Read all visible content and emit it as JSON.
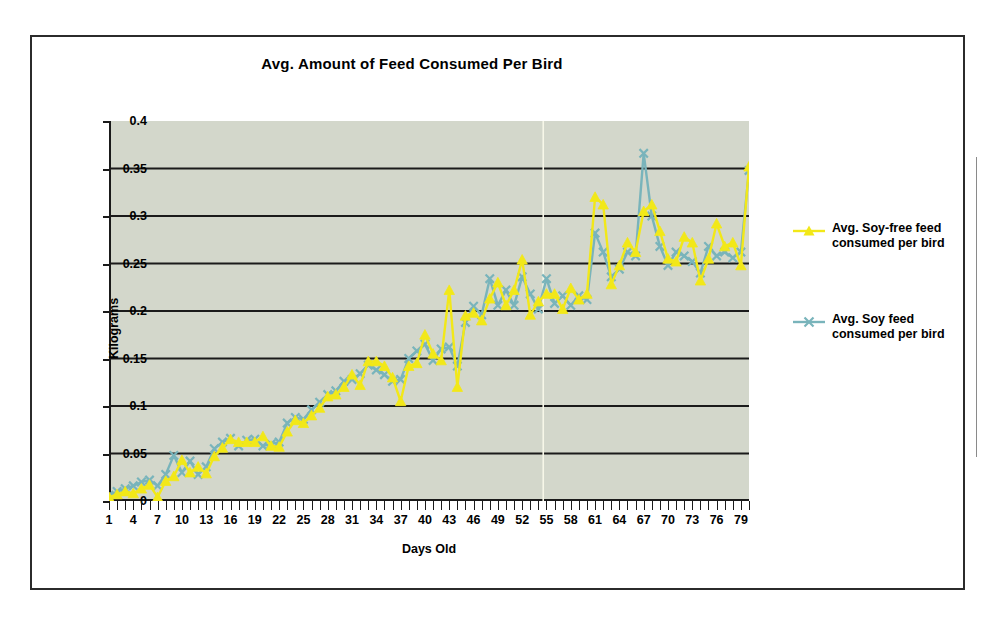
{
  "chart_data": {
    "type": "line",
    "title": "Avg. Amount of Feed Consumed Per Bird",
    "xlabel": "Days Old",
    "ylabel": "Kilograms",
    "grid": true,
    "grid_axis": "y",
    "legend_position": "right",
    "xlim": [
      1,
      80
    ],
    "ylim": [
      0,
      0.4
    ],
    "yticks": [
      0,
      0.05,
      0.1,
      0.15,
      0.2,
      0.25,
      0.3,
      0.35,
      0.4
    ],
    "ytick_labels": [
      "0",
      "0.05",
      "0.1",
      "0.15",
      "0.2",
      "0.25",
      "0.3",
      "0.35",
      "0.4"
    ],
    "xticks": [
      1,
      4,
      7,
      10,
      13,
      16,
      19,
      22,
      25,
      28,
      31,
      34,
      37,
      40,
      43,
      46,
      49,
      52,
      55,
      58,
      61,
      64,
      67,
      70,
      73,
      76,
      79
    ],
    "xtick_labels": [
      "1",
      "4",
      "7",
      "10",
      "13",
      "16",
      "19",
      "22",
      "25",
      "28",
      "31",
      "34",
      "37",
      "40",
      "43",
      "46",
      "49",
      "52",
      "55",
      "58",
      "61",
      "64",
      "67",
      "70",
      "73",
      "76",
      "79"
    ],
    "x": [
      1,
      2,
      3,
      4,
      5,
      6,
      7,
      8,
      9,
      10,
      11,
      12,
      13,
      14,
      15,
      16,
      17,
      18,
      19,
      20,
      21,
      22,
      23,
      24,
      25,
      26,
      27,
      28,
      29,
      30,
      31,
      32,
      33,
      34,
      35,
      36,
      37,
      38,
      39,
      40,
      41,
      42,
      43,
      44,
      45,
      46,
      47,
      48,
      49,
      50,
      51,
      52,
      53,
      54,
      55,
      56,
      57,
      58,
      59,
      60,
      61,
      62,
      63,
      64,
      65,
      66,
      67,
      68,
      69,
      70,
      71,
      72,
      73,
      74,
      75,
      76,
      77,
      78,
      79,
      80
    ],
    "series": [
      {
        "name": "Avg. Soy-free feed consumed per bird",
        "color": "#f2e818",
        "marker": "triangle",
        "values": [
          0.004,
          0.007,
          0.01,
          0.008,
          0.013,
          0.017,
          0.004,
          0.021,
          0.026,
          0.043,
          0.03,
          0.036,
          0.029,
          0.047,
          0.056,
          0.065,
          0.062,
          0.062,
          0.062,
          0.068,
          0.058,
          0.057,
          0.073,
          0.085,
          0.082,
          0.09,
          0.098,
          0.11,
          0.112,
          0.12,
          0.133,
          0.122,
          0.147,
          0.147,
          0.142,
          0.13,
          0.105,
          0.142,
          0.145,
          0.175,
          0.155,
          0.148,
          0.222,
          0.12,
          0.195,
          0.198,
          0.19,
          0.213,
          0.23,
          0.206,
          0.222,
          0.254,
          0.196,
          0.21,
          0.218,
          0.218,
          0.202,
          0.224,
          0.212,
          0.218,
          0.32,
          0.312,
          0.228,
          0.248,
          0.272,
          0.262,
          0.305,
          0.312,
          0.284,
          0.255,
          0.252,
          0.278,
          0.272,
          0.232,
          0.255,
          0.292,
          0.268,
          0.272,
          0.248,
          0.352
        ]
      },
      {
        "name": "Avg. Soy feed consumed per bird",
        "color": "#79b4bb",
        "marker": "x",
        "values": [
          0.006,
          0.01,
          0.013,
          0.016,
          0.02,
          0.022,
          0.016,
          0.028,
          0.048,
          0.03,
          0.042,
          0.028,
          0.036,
          0.055,
          0.062,
          0.066,
          0.058,
          0.064,
          0.065,
          0.058,
          0.06,
          0.062,
          0.082,
          0.088,
          0.086,
          0.096,
          0.104,
          0.112,
          0.116,
          0.126,
          0.128,
          0.134,
          0.143,
          0.138,
          0.133,
          0.126,
          0.128,
          0.15,
          0.158,
          0.165,
          0.148,
          0.16,
          0.162,
          0.142,
          0.188,
          0.205,
          0.196,
          0.234,
          0.206,
          0.222,
          0.206,
          0.236,
          0.218,
          0.202,
          0.234,
          0.208,
          0.216,
          0.206,
          0.216,
          0.212,
          0.282,
          0.262,
          0.236,
          0.244,
          0.262,
          0.258,
          0.366,
          0.3,
          0.268,
          0.248,
          0.262,
          0.258,
          0.252,
          0.24,
          0.268,
          0.258,
          0.262,
          0.256,
          0.262,
          0.348
        ]
      }
    ]
  },
  "legend": {
    "entries": [
      {
        "label_line1": "Avg. Soy-free feed",
        "label_line2": "consumed per bird",
        "color": "#f2e818"
      },
      {
        "label_line1": "Avg. Soy feed",
        "label_line2": "consumed per bird",
        "color": "#79b4bb"
      }
    ]
  },
  "colors": {
    "plot_background": "#d3d7cb",
    "gridline": "#1a1a1a",
    "axis": "#1a1a1a",
    "frame_border": "#2b2b2b",
    "page_background": "#ffffff",
    "soy_free": "#f2e818",
    "soy": "#79b4bb"
  }
}
